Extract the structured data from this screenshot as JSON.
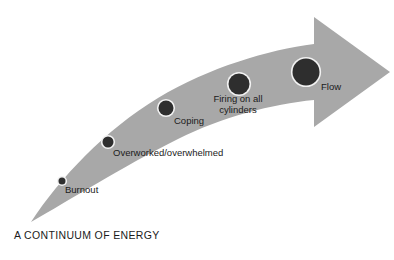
{
  "caption": "A CONTINUUM OF ENERGY",
  "colors": {
    "background": "#ffffff",
    "arrow_fill": "#a8a8a8",
    "node_fill": "#2e2e2e",
    "node_ring": "#f2f2f2",
    "text": "#1b1b1b"
  },
  "arrow": {
    "name": "energy-continuum-arrow",
    "direction": "up-right",
    "tail_position": "bottom-left",
    "head_position": "top-right"
  },
  "chart_data": {
    "type": "diagram",
    "title": "A CONTINUUM OF ENERGY",
    "xlabel": "",
    "ylabel": "",
    "categories": [
      "Burnout",
      "Overworked/overwhelmed",
      "Coping",
      "Firing on all cylinders",
      "Flow"
    ],
    "values": [
      1,
      2,
      3,
      4,
      5
    ],
    "marker_sizes": [
      7,
      11,
      15,
      21,
      27
    ],
    "legend": [],
    "grid": false
  },
  "stages": [
    {
      "id": "burnout",
      "label": "Burnout",
      "lines": [
        "Burnout"
      ],
      "cx": 62,
      "cy": 181,
      "r": 3.5,
      "label_x": 65,
      "label_y": 184,
      "two_line": false
    },
    {
      "id": "overworked-overwhelmed",
      "label": "Overworked/overwhelmed",
      "lines": [
        "Overworked/overwhelmed"
      ],
      "cx": 108,
      "cy": 142,
      "r": 5.5,
      "label_x": 113,
      "label_y": 147,
      "two_line": false
    },
    {
      "id": "coping",
      "label": "Coping",
      "lines": [
        "Coping"
      ],
      "cx": 166,
      "cy": 108,
      "r": 7.5,
      "label_x": 174,
      "label_y": 115,
      "two_line": false
    },
    {
      "id": "firing-on-all-cylinders",
      "label": "Firing on all cylinders",
      "lines": [
        "Firing on all",
        "cylinders"
      ],
      "cx": 239,
      "cy": 84,
      "r": 10.5,
      "label_x": 238,
      "label_y": 93,
      "two_line": true
    },
    {
      "id": "flow",
      "label": "Flow",
      "lines": [
        "Flow"
      ],
      "cx": 306,
      "cy": 72,
      "r": 13.5,
      "label_x": 321,
      "label_y": 81,
      "two_line": false
    }
  ]
}
